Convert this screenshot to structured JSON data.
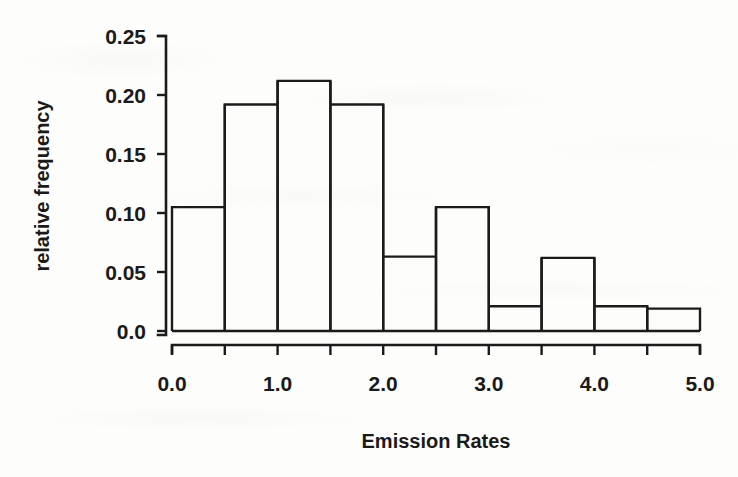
{
  "figure": {
    "background_color": "#fdfdfb",
    "ink_color": "#1b1b1b"
  },
  "chart_data": {
    "type": "bar",
    "title": "",
    "xlabel": "Emission Rates",
    "ylabel": "relative frequency",
    "grid": false,
    "legend": "none",
    "xlim": [
      0.0,
      5.0
    ],
    "ylim": [
      0.0,
      0.25
    ],
    "bin_width": 0.5,
    "bin_edges": [
      0.0,
      0.5,
      1.0,
      1.5,
      2.0,
      2.5,
      3.0,
      3.5,
      4.0,
      4.5,
      5.0
    ],
    "categories": [
      "0.0-0.5",
      "0.5-1.0",
      "1.0-1.5",
      "1.5-2.0",
      "2.0-2.5",
      "2.5-3.0",
      "3.0-3.5",
      "3.5-4.0",
      "4.0-4.5",
      "4.5-5.0"
    ],
    "values": [
      0.105,
      0.192,
      0.212,
      0.192,
      0.063,
      0.105,
      0.021,
      0.062,
      0.021,
      0.019
    ],
    "x_ticks": [
      0.0,
      0.5,
      1.0,
      1.5,
      2.0,
      2.5,
      3.0,
      3.5,
      4.0,
      4.5,
      5.0
    ],
    "x_tick_labels": [
      "0.0",
      "",
      "1.0",
      "",
      "2.0",
      "",
      "3.0",
      "",
      "4.0",
      "",
      "5.0"
    ],
    "y_ticks": [
      0.0,
      0.05,
      0.1,
      0.15,
      0.2,
      0.25
    ],
    "y_tick_labels": [
      "0.0",
      "0.05",
      "0.10",
      "0.15",
      "0.20",
      "0.25"
    ]
  }
}
